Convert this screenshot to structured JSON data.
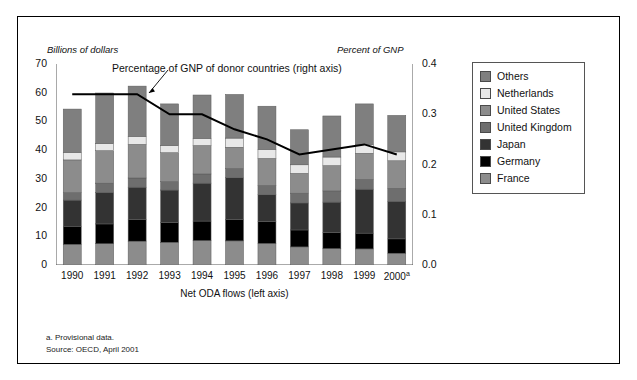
{
  "figure": {
    "left_axis_title": "Billions of dollars",
    "right_axis_title": "Percent of GNP",
    "annotation": "Percentage of GNP of donor countries (right axis)",
    "xaxis_label": "Net ODA flows (left axis)",
    "note_a": "a. Provisional data.",
    "note_source": "Source: OECD, April 2001"
  },
  "legend": {
    "items": [
      {
        "label": "Others",
        "color": "#7f7f7f"
      },
      {
        "label": "Netherlands",
        "color": "#e8e8e8"
      },
      {
        "label": "United States",
        "color": "#8c8c8c"
      },
      {
        "label": "United Kingdom",
        "color": "#6e6e6e"
      },
      {
        "label": "Japan",
        "color": "#333333"
      },
      {
        "label": "Germany",
        "color": "#000000"
      },
      {
        "label": "France",
        "color": "#8c8c8c"
      }
    ]
  },
  "chart_data": {
    "type": "bar",
    "title": "",
    "subtitle": "",
    "xlabel": "Net ODA flows (left axis)",
    "ylabel": "Billions of dollars",
    "y2label": "Percent of GNP",
    "ylim": [
      0,
      70
    ],
    "y2lim": [
      0.0,
      0.4
    ],
    "yticks": [
      0,
      10,
      20,
      30,
      40,
      50,
      60,
      70
    ],
    "y2ticks": [
      0.0,
      0.1,
      0.2,
      0.3,
      0.4
    ],
    "y2minorticks": [
      0.05,
      0.15,
      0.25,
      0.35
    ],
    "grid": false,
    "legend_position": "right-outside",
    "stacked": true,
    "categories": [
      "1990",
      "1991",
      "1992",
      "1993",
      "1994",
      "1995",
      "1996",
      "1997",
      "1998",
      "1999",
      "2000"
    ],
    "category_footnotes": {
      "2000": "a"
    },
    "series": [
      {
        "name": "France",
        "color": "#8c8c8c",
        "values": [
          7.2,
          7.4,
          8.3,
          7.9,
          8.5,
          8.4,
          7.5,
          6.3,
          5.7,
          5.6,
          4.1
        ]
      },
      {
        "name": "Germany",
        "color": "#000000",
        "values": [
          6.3,
          6.9,
          7.6,
          6.9,
          6.8,
          7.5,
          7.6,
          5.9,
          5.6,
          5.5,
          5.0
        ]
      },
      {
        "name": "Japan",
        "color": "#333333",
        "values": [
          9.1,
          11.0,
          11.2,
          11.3,
          13.2,
          14.5,
          9.4,
          9.4,
          10.6,
          15.3,
          13.1
        ]
      },
      {
        "name": "United Kingdom",
        "color": "#6e6e6e",
        "values": [
          2.6,
          3.2,
          3.2,
          2.9,
          3.2,
          3.2,
          3.2,
          3.4,
          3.9,
          3.4,
          4.5
        ]
      },
      {
        "name": "United States",
        "color": "#8c8c8c",
        "values": [
          11.4,
          11.3,
          11.7,
          10.1,
          9.9,
          7.4,
          9.4,
          6.9,
          8.8,
          9.1,
          9.6
        ]
      },
      {
        "name": "Netherlands",
        "color": "#e8e8e8",
        "values": [
          2.6,
          2.5,
          2.8,
          2.5,
          2.5,
          3.2,
          3.2,
          3.0,
          3.0,
          3.1,
          3.1
        ]
      },
      {
        "name": "Others",
        "color": "#7f7f7f",
        "values": [
          15.1,
          17.6,
          17.5,
          14.5,
          15.1,
          15.2,
          15.0,
          12.2,
          14.3,
          14.1,
          12.7
        ]
      }
    ],
    "line_series": {
      "name": "Percentage of GNP of donor countries (right axis)",
      "axis": "right",
      "color": "#000000",
      "x": [
        "1990",
        "1991",
        "1992",
        "1993",
        "1994",
        "1995",
        "1996",
        "1997",
        "1998",
        "1999",
        "2000"
      ],
      "values": [
        0.34,
        0.34,
        0.34,
        0.3,
        0.3,
        0.27,
        0.25,
        0.22,
        0.23,
        0.24,
        0.22
      ]
    }
  }
}
